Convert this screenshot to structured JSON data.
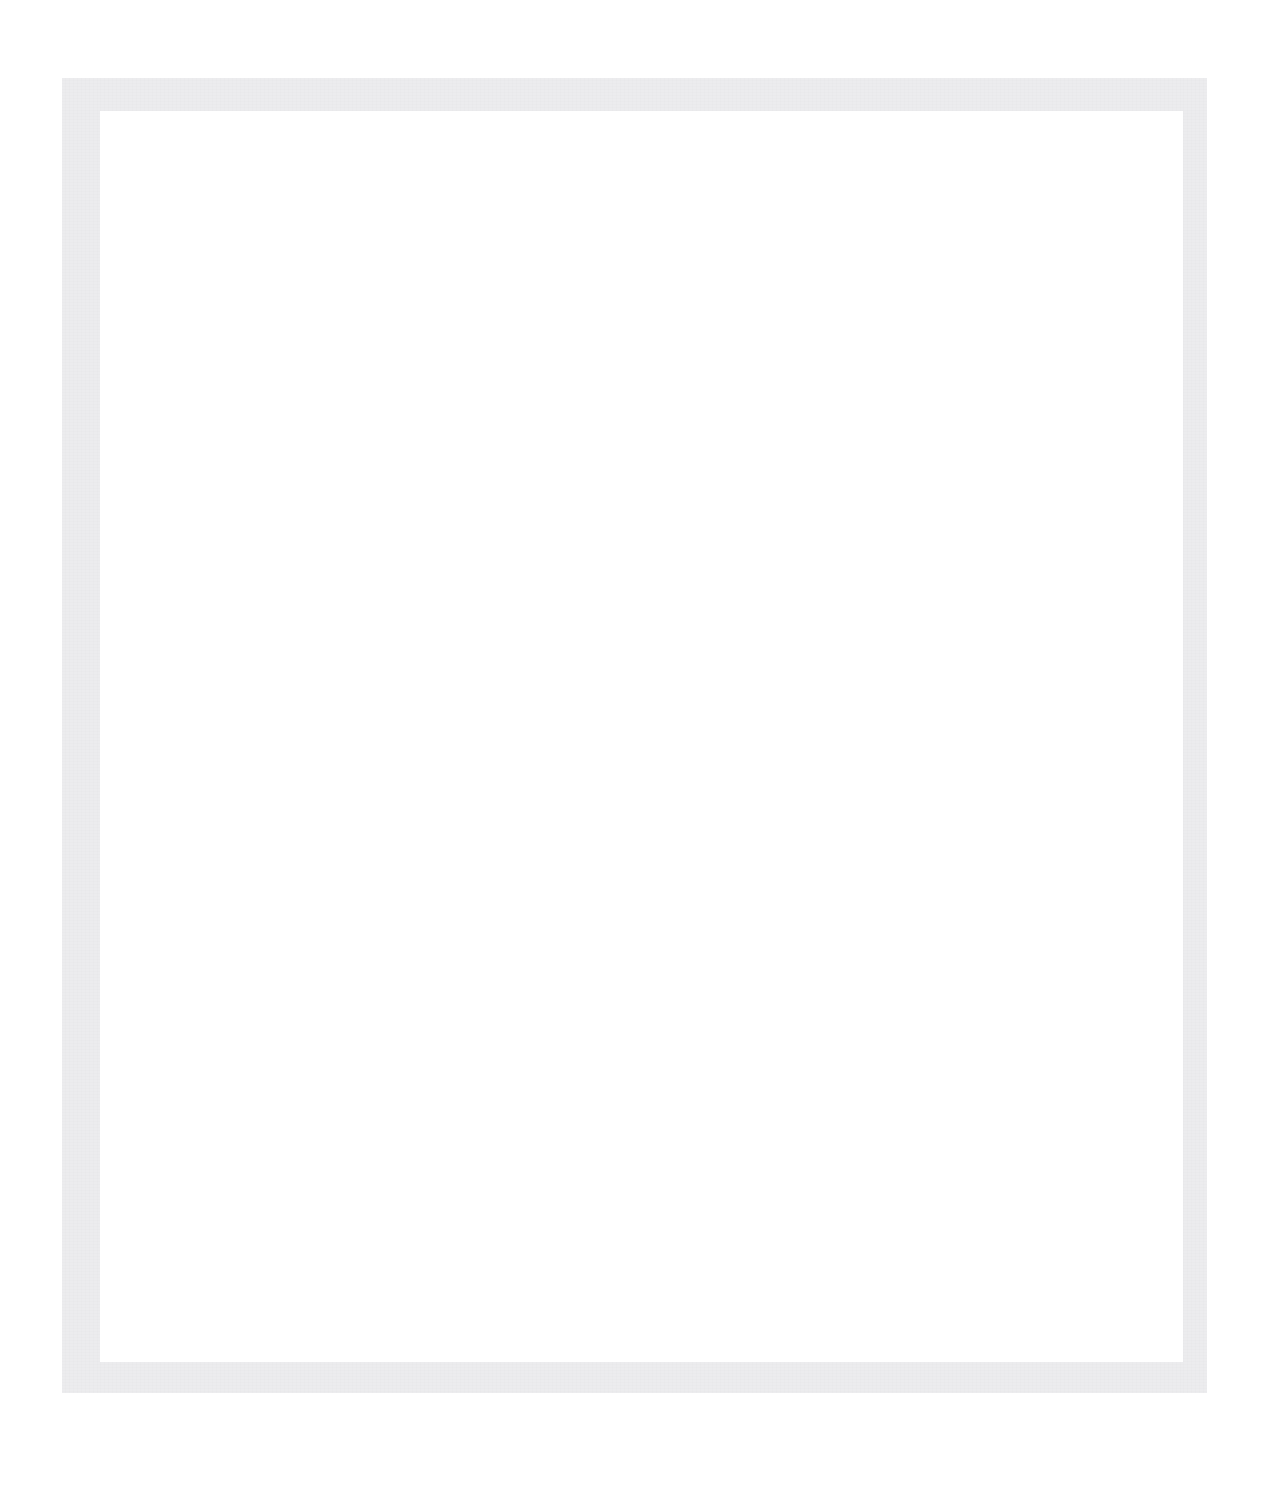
{
  "page": {
    "title": "",
    "background_color": "#ffffff",
    "width": 1282,
    "height": 1485
  },
  "clipped_header": {
    "text": "",
    "color": "#f4f5f6",
    "note": "faint text remnant clipped at the top edge of the image"
  },
  "frame": {
    "border_color": "#ececee",
    "fill_color": "#ffffff",
    "outer_left": 62,
    "outer_top": 78,
    "outer_right": 1207,
    "outer_bottom": 1393,
    "border_width_top": 33,
    "border_width_right": 24,
    "border_width_bottom": 31,
    "border_width_left": 38
  },
  "interior": {
    "content": "",
    "background_color": "#ffffff"
  }
}
